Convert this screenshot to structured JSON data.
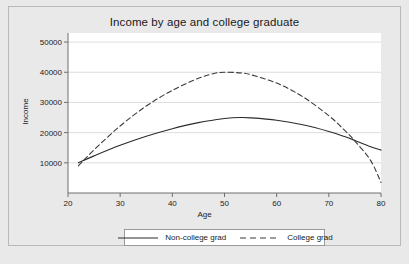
{
  "chart_data": {
    "type": "line",
    "title": "Income by age and college graduate",
    "xlabel": "Age",
    "ylabel": "Income",
    "xlim": [
      20,
      80
    ],
    "ylim": [
      0,
      53000
    ],
    "xticks": [
      20,
      30,
      40,
      50,
      60,
      70,
      80
    ],
    "yticks": [
      10000,
      20000,
      30000,
      40000,
      50000
    ],
    "xtick_labels": [
      "20",
      "30",
      "40",
      "50",
      "60",
      "70",
      "80"
    ],
    "ytick_labels": [
      "10000",
      "20000",
      "30000",
      "40000",
      "50000"
    ],
    "grid": "horizontal",
    "legend_position": "bottom",
    "x": [
      22,
      25,
      30,
      35,
      40,
      45,
      48,
      50,
      53,
      55,
      60,
      65,
      70,
      73,
      75,
      78,
      80
    ],
    "series": [
      {
        "name": "Non-college grad",
        "style": "solid",
        "color": "#2b2b2b",
        "values": [
          10000,
          12300,
          15800,
          18800,
          21300,
          23300,
          24200,
          24700,
          25000,
          24900,
          24100,
          22600,
          20400,
          18700,
          17400,
          15300,
          14200
        ]
      },
      {
        "name": "College grad",
        "style": "dashed",
        "color": "#3a3a3a",
        "values": [
          9000,
          14300,
          22200,
          28800,
          34000,
          38000,
          39600,
          40000,
          39800,
          39200,
          36400,
          31900,
          25600,
          20800,
          17200,
          10800,
          3500
        ]
      }
    ]
  },
  "legend": {
    "items": [
      {
        "label": "Non-college grad",
        "style": "solid"
      },
      {
        "label": "College grad",
        "style": "dashed"
      }
    ]
  },
  "colors": {
    "figure_background": "#e9e9e9",
    "plot_background": "#ffffff",
    "gridline": "#d9d9d9",
    "axis": "#6f6f6f",
    "text": "#1a1a1a"
  }
}
